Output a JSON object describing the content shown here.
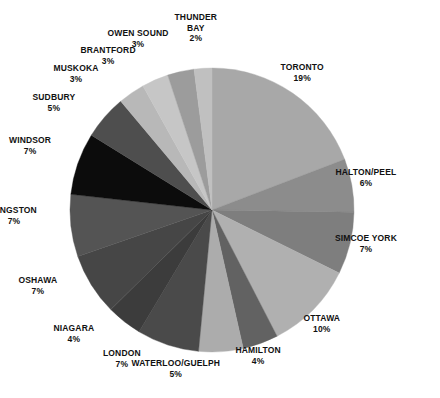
{
  "chart_data": {
    "type": "pie",
    "title": "",
    "subtitle": "",
    "xlabel": "",
    "ylabel": "",
    "legend_position": "none",
    "grid": false,
    "units": "percent",
    "start_angle_deg": 0,
    "direction": "clockwise",
    "categories": [
      "TORONTO",
      "HALTON/PEEL",
      "SIMCOE YORK",
      "OTTAWA",
      "HAMILTON",
      "WATERLOO/GUELPH",
      "LONDON",
      "NIAGARA",
      "OSHAWA",
      "KINGSTON",
      "WINDSOR",
      "SUDBURY",
      "MUSKOKA",
      "BRANTFORD",
      "OWEN SOUND",
      "THUNDER BAY"
    ],
    "values": [
      19,
      6,
      7,
      10,
      4,
      5,
      7,
      4,
      7,
      7,
      7,
      5,
      3,
      3,
      3,
      2
    ],
    "value_labels": [
      "19%",
      "6%",
      "7%",
      "10%",
      "4%",
      "5%",
      "7%",
      "4%",
      "7%",
      "7%",
      "7%",
      "5%",
      "3%",
      "3%",
      "3%",
      "2%"
    ],
    "colors": [
      "#a8a8a8",
      "#8c8c8c",
      "#7e7e7e",
      "#b0b0b0",
      "#626262",
      "#acacac",
      "#4a4a4a",
      "#3c3c3c",
      "#464646",
      "#545454",
      "#0c0c0c",
      "#4e4e4e",
      "#b8b8b8",
      "#c6c6c6",
      "#9c9c9c",
      "#c0c0c0"
    ],
    "slices": [
      {
        "name": "TORONTO",
        "pct": "19%",
        "value": 19,
        "color": "#a8a8a8"
      },
      {
        "name": "HALTON/PEEL",
        "pct": "6%",
        "value": 6,
        "color": "#8c8c8c"
      },
      {
        "name": "SIMCOE YORK",
        "pct": "7%",
        "value": 7,
        "color": "#7e7e7e"
      },
      {
        "name": "OTTAWA",
        "pct": "10%",
        "value": 10,
        "color": "#b0b0b0"
      },
      {
        "name": "HAMILTON",
        "pct": "4%",
        "value": 4,
        "color": "#626262"
      },
      {
        "name": "WATERLOO/GUELPH",
        "pct": "5%",
        "value": 5,
        "color": "#acacac"
      },
      {
        "name": "LONDON",
        "pct": "7%",
        "value": 7,
        "color": "#4a4a4a"
      },
      {
        "name": "NIAGARA",
        "pct": "4%",
        "value": 4,
        "color": "#3c3c3c"
      },
      {
        "name": "OSHAWA",
        "pct": "7%",
        "value": 7,
        "color": "#464646"
      },
      {
        "name": "KINGSTON",
        "pct": "7%",
        "value": 7,
        "color": "#545454"
      },
      {
        "name": "WINDSOR",
        "pct": "7%",
        "value": 7,
        "color": "#0c0c0c"
      },
      {
        "name": "SUDBURY",
        "pct": "5%",
        "value": 5,
        "color": "#4e4e4e"
      },
      {
        "name": "MUSKOKA",
        "pct": "3%",
        "value": 3,
        "color": "#b8b8b8"
      },
      {
        "name": "BRANTFORD",
        "pct": "3%",
        "value": 3,
        "color": "#c6c6c6"
      },
      {
        "name": "OWEN SOUND",
        "pct": "3%",
        "value": 3,
        "color": "#9c9c9c"
      },
      {
        "name": "THUNDER BAY",
        "pct": "2%",
        "value": 2,
        "color": "#c0c0c0"
      }
    ]
  },
  "labels": [
    {
      "name": "THUNDER",
      "name2": "BAY",
      "pct": "2%",
      "x": 196,
      "y": 12,
      "align": "center"
    },
    {
      "name": "OWEN SOUND",
      "pct": "3%",
      "x": 138,
      "y": 28,
      "align": "center"
    },
    {
      "name": "BRANTFORD",
      "pct": "3%",
      "x": 108,
      "y": 45,
      "align": "center"
    },
    {
      "name": "MUSKOKA",
      "pct": "3%",
      "x": 76,
      "y": 63,
      "align": "center"
    },
    {
      "name": "SUDBURY",
      "pct": "5%",
      "x": 54,
      "y": 92,
      "align": "center"
    },
    {
      "name": "WINDSOR",
      "pct": "7%",
      "x": 30,
      "y": 135,
      "align": "center"
    },
    {
      "name": "KINGSTON",
      "pct": "7%",
      "x": 14,
      "y": 205,
      "align": "center"
    },
    {
      "name": "OSHAWA",
      "pct": "7%",
      "x": 38,
      "y": 275,
      "align": "center"
    },
    {
      "name": "NIAGARA",
      "pct": "4%",
      "x": 74,
      "y": 323,
      "align": "center"
    },
    {
      "name": "LONDON",
      "pct": "7%",
      "x": 122,
      "y": 348,
      "align": "center"
    },
    {
      "name": "WATERLOO/GUELPH",
      "pct": "5%",
      "x": 176,
      "y": 358,
      "align": "center"
    },
    {
      "name": "HAMILTON",
      "pct": "4%",
      "x": 258,
      "y": 345,
      "align": "center"
    },
    {
      "name": "OTTAWA",
      "pct": "10%",
      "x": 322,
      "y": 313,
      "align": "center"
    },
    {
      "name": "SIMCOE YORK",
      "pct": "7%",
      "x": 366,
      "y": 233,
      "align": "center"
    },
    {
      "name": "HALTON/PEEL",
      "pct": "6%",
      "x": 366,
      "y": 167,
      "align": "center"
    },
    {
      "name": "TORONTO",
      "pct": "19%",
      "x": 302,
      "y": 62,
      "align": "center"
    }
  ],
  "geometry": {
    "cx": 212,
    "cy": 210,
    "r": 142
  }
}
